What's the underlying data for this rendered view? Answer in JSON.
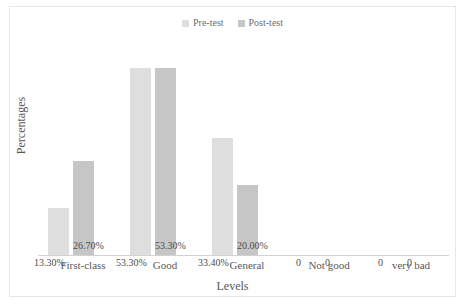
{
  "chart_data": {
    "type": "bar",
    "title": "",
    "xlabel": "Levels",
    "ylabel": "Percentages",
    "categories": [
      "First-class",
      "Good",
      "General",
      "Not good",
      "very bad"
    ],
    "series": [
      {
        "name": "Pre-test",
        "color": "#dedede",
        "values": [
          13.3,
          53.3,
          33.4,
          0,
          0
        ],
        "labels": [
          "13.30%",
          "53.30%",
          "33.40%",
          "0",
          "0"
        ]
      },
      {
        "name": "Post-test",
        "color": "#c6c6c6",
        "values": [
          26.7,
          53.3,
          20.0,
          0,
          0
        ],
        "labels": [
          "26.70%",
          "53.30%",
          "20.00%",
          "0",
          "0"
        ]
      }
    ],
    "ylim": [
      0,
      60
    ],
    "grid": false,
    "legend_position": "top-center",
    "axis_color": "#d2d2d2",
    "text_color": "#595959",
    "frame_color": "#e6e6e6"
  }
}
